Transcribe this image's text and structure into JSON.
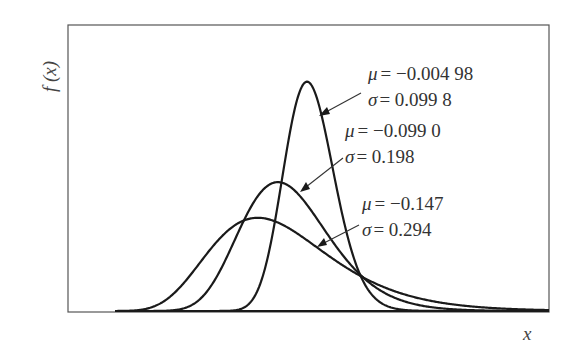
{
  "chart_data": {
    "type": "line",
    "title": "",
    "xlabel": "x",
    "ylabel": "f (x)",
    "grid": false,
    "legend": "inline annotations with arrows",
    "distribution": "lognormal",
    "series": [
      {
        "name": "curve-1",
        "mu": -0.00498,
        "sigma": 0.0998,
        "mu_label": "μ = −0.004 98",
        "sigma_label": "σ = 0.099 8",
        "mode": 0.985,
        "peak_density": 4.04
      },
      {
        "name": "curve-2",
        "mu": -0.099,
        "sigma": 0.198,
        "mu_label": "μ = −0.099 0",
        "sigma_label": "σ = 0.198",
        "mode": 0.871,
        "peak_density": 2.27
      },
      {
        "name": "curve-3",
        "mu": -0.147,
        "sigma": 0.294,
        "mu_label": "μ = −0.147",
        "sigma_label": "σ = 0.294",
        "mode": 0.792,
        "peak_density": 1.64
      }
    ],
    "xlim": [
      0.0,
      2.0
    ],
    "ylim": [
      0,
      4.3
    ]
  },
  "annotations": [
    {
      "mu_prefix": "μ",
      "mu_value": "= −0.004 98",
      "sigma_prefix": "σ",
      "sigma_value": "= 0.099 8"
    },
    {
      "mu_prefix": "μ",
      "mu_value": "= −0.099 0",
      "sigma_prefix": "σ",
      "sigma_value": "= 0.198"
    },
    {
      "mu_prefix": "μ",
      "mu_value": "= −0.147",
      "sigma_prefix": "σ",
      "sigma_value": "= 0.294"
    }
  ],
  "axes": {
    "x_label": "x",
    "y_label": "f (x)"
  }
}
